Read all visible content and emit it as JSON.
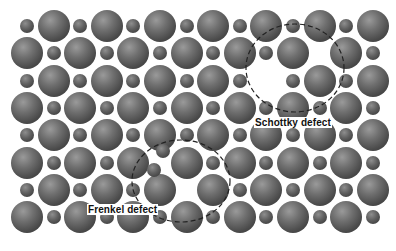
{
  "figure": {
    "background": "#ffffff",
    "lattice": {
      "rows": 8,
      "columns": 14,
      "x0": 27,
      "y0": 26,
      "dx": 26.6,
      "dy": 27.3,
      "big_radius": 16,
      "small_radius": 7,
      "pattern": "alternating big/small ions; even rows start with small, odd rows start with big",
      "vacancies": [
        {
          "row": 1,
          "col": 11,
          "ion": "small",
          "defect": "schottky"
        },
        {
          "row": 2,
          "col": 9,
          "ion": "big",
          "defect": "schottky"
        },
        {
          "row": 5,
          "col": 5,
          "ion": "small",
          "defect": "frenkel"
        },
        {
          "row": 6,
          "col": 6,
          "ion": "small",
          "defect": "frenkel"
        }
      ],
      "interstitials": [
        {
          "x": 163,
          "y": 151,
          "ion": "small"
        },
        {
          "x": 154,
          "y": 170,
          "ion": "small"
        }
      ]
    },
    "annotations": [
      {
        "id": "schottky",
        "label": "Schottky defect",
        "circle": {
          "cx": 295,
          "cy": 68,
          "rx": 49,
          "ry": 44
        },
        "label_pos": {
          "x": 254,
          "y": 117
        }
      },
      {
        "id": "frenkel",
        "label": "Frenkel defect",
        "circle": {
          "cx": 181,
          "cy": 181,
          "rx": 49,
          "ry": 41
        },
        "label_pos": {
          "x": 87,
          "y": 204
        }
      }
    ],
    "colors": {
      "ion_dark": "#333333",
      "ion_light": "#9a9a9a",
      "dash": "#222222",
      "label_text": "#111111"
    }
  }
}
